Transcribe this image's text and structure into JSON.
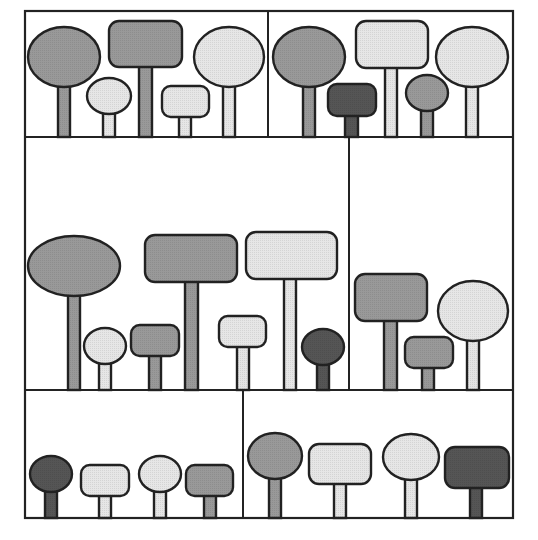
{
  "figure": {
    "colors": {
      "medium": "#999999",
      "light": "#e6e6e6",
      "dark": "#555555",
      "stroke": "#222222",
      "background": "#ffffff"
    },
    "frame": {
      "x": 25,
      "y": 11,
      "w": 488,
      "h": 507
    },
    "panels": [
      {
        "name": "panel-top-left",
        "x": 25,
        "y": 11,
        "w": 243,
        "h": 126,
        "trees": [
          {
            "crown": "ellipse",
            "shade": "medium",
            "cx": 64,
            "cy": 57,
            "rx": 36,
            "ry": 30,
            "trunk_x": 58,
            "trunk_w": 12,
            "base_y": 137
          },
          {
            "crown": "ellipse",
            "shade": "light",
            "cx": 109,
            "cy": 96,
            "rx": 22,
            "ry": 18,
            "trunk_x": 103,
            "trunk_w": 12,
            "base_y": 137
          },
          {
            "crown": "rect",
            "shade": "medium",
            "x": 109,
            "y": 21,
            "w": 73,
            "h": 46,
            "trunk_x": 139,
            "trunk_w": 13,
            "base_y": 137
          },
          {
            "crown": "rect",
            "shade": "light",
            "x": 162,
            "y": 86,
            "w": 47,
            "h": 31,
            "trunk_x": 179,
            "trunk_w": 12,
            "base_y": 137
          },
          {
            "crown": "ellipse",
            "shade": "light",
            "cx": 229,
            "cy": 57,
            "rx": 35,
            "ry": 30,
            "trunk_x": 223,
            "trunk_w": 12,
            "base_y": 137
          }
        ]
      },
      {
        "name": "panel-top-right",
        "x": 268,
        "y": 11,
        "w": 245,
        "h": 126,
        "trees": [
          {
            "crown": "ellipse",
            "shade": "medium",
            "cx": 309,
            "cy": 57,
            "rx": 36,
            "ry": 30,
            "trunk_x": 303,
            "trunk_w": 12,
            "base_y": 137
          },
          {
            "crown": "rect",
            "shade": "dark",
            "x": 328,
            "y": 84,
            "w": 48,
            "h": 32,
            "trunk_x": 345,
            "trunk_w": 13,
            "base_y": 137
          },
          {
            "crown": "rect",
            "shade": "light",
            "x": 356,
            "y": 21,
            "w": 72,
            "h": 47,
            "trunk_x": 385,
            "trunk_w": 12,
            "base_y": 137
          },
          {
            "crown": "ellipse",
            "shade": "medium",
            "cx": 427,
            "cy": 93,
            "rx": 21,
            "ry": 18,
            "trunk_x": 421,
            "trunk_w": 12,
            "base_y": 137
          },
          {
            "crown": "ellipse",
            "shade": "light",
            "cx": 472,
            "cy": 57,
            "rx": 36,
            "ry": 30,
            "trunk_x": 466,
            "trunk_w": 12,
            "base_y": 137
          }
        ]
      },
      {
        "name": "panel-middle-left",
        "x": 25,
        "y": 137,
        "w": 324,
        "h": 253,
        "trees": [
          {
            "crown": "ellipse",
            "shade": "medium",
            "cx": 74,
            "cy": 266,
            "rx": 46,
            "ry": 30,
            "trunk_x": 68,
            "trunk_w": 12,
            "base_y": 390
          },
          {
            "crown": "ellipse",
            "shade": "light",
            "cx": 105,
            "cy": 346,
            "rx": 21,
            "ry": 18,
            "trunk_x": 99,
            "trunk_w": 12,
            "base_y": 390
          },
          {
            "crown": "rect",
            "shade": "medium",
            "x": 131,
            "y": 325,
            "w": 48,
            "h": 31,
            "trunk_x": 149,
            "trunk_w": 12,
            "base_y": 390
          },
          {
            "crown": "rect",
            "shade": "medium",
            "x": 145,
            "y": 235,
            "w": 92,
            "h": 47,
            "trunk_x": 185,
            "trunk_w": 13,
            "base_y": 390
          },
          {
            "crown": "rect",
            "shade": "light",
            "x": 219,
            "y": 316,
            "w": 47,
            "h": 31,
            "trunk_x": 237,
            "trunk_w": 12,
            "base_y": 390
          },
          {
            "crown": "rect",
            "shade": "light",
            "x": 246,
            "y": 232,
            "w": 91,
            "h": 47,
            "trunk_x": 284,
            "trunk_w": 12,
            "base_y": 390
          },
          {
            "crown": "ellipse",
            "shade": "dark",
            "cx": 323,
            "cy": 347,
            "rx": 21,
            "ry": 18,
            "trunk_x": 317,
            "trunk_w": 12,
            "base_y": 390
          }
        ]
      },
      {
        "name": "panel-middle-right",
        "x": 349,
        "y": 137,
        "w": 164,
        "h": 253,
        "trees": [
          {
            "crown": "rect",
            "shade": "medium",
            "x": 355,
            "y": 274,
            "w": 72,
            "h": 47,
            "trunk_x": 384,
            "trunk_w": 13,
            "base_y": 390
          },
          {
            "crown": "rect",
            "shade": "medium",
            "x": 405,
            "y": 337,
            "w": 48,
            "h": 31,
            "trunk_x": 422,
            "trunk_w": 12,
            "base_y": 390
          },
          {
            "crown": "ellipse",
            "shade": "light",
            "cx": 473,
            "cy": 311,
            "rx": 35,
            "ry": 30,
            "trunk_x": 467,
            "trunk_w": 12,
            "base_y": 390
          }
        ]
      },
      {
        "name": "panel-bottom-left",
        "x": 25,
        "y": 390,
        "w": 218,
        "h": 128,
        "trees": [
          {
            "crown": "ellipse",
            "shade": "dark",
            "cx": 51,
            "cy": 474,
            "rx": 21,
            "ry": 18,
            "trunk_x": 45,
            "trunk_w": 12,
            "base_y": 518
          },
          {
            "crown": "rect",
            "shade": "light",
            "x": 81,
            "y": 465,
            "w": 48,
            "h": 31,
            "trunk_x": 99,
            "trunk_w": 12,
            "base_y": 518
          },
          {
            "crown": "ellipse",
            "shade": "light",
            "cx": 160,
            "cy": 474,
            "rx": 21,
            "ry": 18,
            "trunk_x": 154,
            "trunk_w": 12,
            "base_y": 518
          },
          {
            "crown": "rect",
            "shade": "medium",
            "x": 186,
            "y": 465,
            "w": 47,
            "h": 31,
            "trunk_x": 204,
            "trunk_w": 12,
            "base_y": 518
          }
        ]
      },
      {
        "name": "panel-bottom-right",
        "x": 243,
        "y": 390,
        "w": 270,
        "h": 128,
        "trees": [
          {
            "crown": "ellipse",
            "shade": "medium",
            "cx": 275,
            "cy": 456,
            "rx": 27,
            "ry": 23,
            "trunk_x": 269,
            "trunk_w": 12,
            "base_y": 518
          },
          {
            "crown": "rect",
            "shade": "light",
            "x": 309,
            "y": 444,
            "w": 62,
            "h": 40,
            "trunk_x": 334,
            "trunk_w": 12,
            "base_y": 518
          },
          {
            "crown": "ellipse",
            "shade": "light",
            "cx": 411,
            "cy": 457,
            "rx": 28,
            "ry": 23,
            "trunk_x": 405,
            "trunk_w": 12,
            "base_y": 518
          },
          {
            "crown": "rect",
            "shade": "dark",
            "x": 445,
            "y": 447,
            "w": 64,
            "h": 41,
            "trunk_x": 470,
            "trunk_w": 12,
            "base_y": 518
          }
        ]
      }
    ]
  }
}
